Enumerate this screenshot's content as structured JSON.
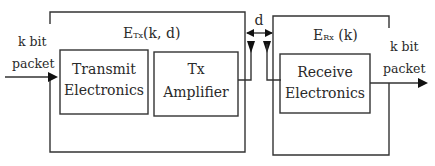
{
  "diagram": {
    "type": "block-diagram",
    "input": {
      "line1": "k bit",
      "line2": "packet"
    },
    "output": {
      "line1": "k bit",
      "line2": "packet"
    },
    "transmitter": {
      "energy_label_main": "E",
      "energy_label_sub": "Tx",
      "energy_label_args": "(k, d)",
      "blocks": [
        {
          "line1": "Transmit",
          "line2": "Electronics"
        },
        {
          "line1": "Tx",
          "line2": "Amplifier"
        }
      ]
    },
    "receiver": {
      "energy_label_main": "E",
      "energy_label_sub": "Rx",
      "energy_label_args": " (k)",
      "blocks": [
        {
          "line1": "Receive",
          "line2": "Electronics"
        }
      ]
    },
    "distance_label": "d"
  }
}
